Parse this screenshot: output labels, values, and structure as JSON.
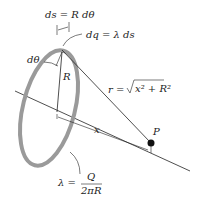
{
  "diagram": {
    "labels": {
      "ds": "ds = R dθ",
      "dq": "dq = λ ds",
      "dtheta": "dθ",
      "R": "R",
      "r_lhs": "r =",
      "r_rad": "x² + R²",
      "x": "x",
      "P": "P",
      "lambda_lhs": "λ =",
      "lambda_num": "Q",
      "lambda_den": "2πR"
    },
    "colors": {
      "ring": "#9a9a9a",
      "lines": "#222222",
      "point": "#111111",
      "text": "#222222"
    }
  }
}
